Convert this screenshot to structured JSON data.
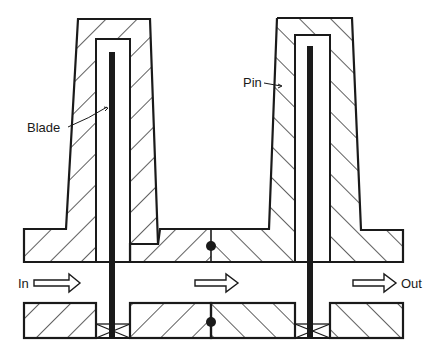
{
  "diagram": {
    "type": "cross-section",
    "labels": {
      "blade": "Blade",
      "pin": "Pin",
      "inlet": "In",
      "outlet": "Out"
    },
    "flow_direction": "left-to-right",
    "components": [
      "left-tower",
      "right-tower",
      "blade-left",
      "blade-right",
      "flow-channel",
      "pin-joints",
      "blade-seals"
    ],
    "colors": {
      "line": "#1a1a1a",
      "background": "#ffffff"
    }
  }
}
